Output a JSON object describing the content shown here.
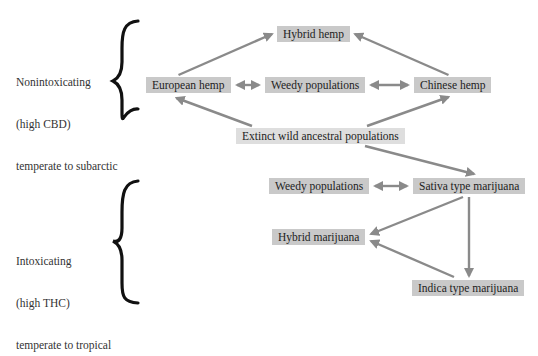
{
  "groups": [
    {
      "id": "nonintoxicating",
      "lines": [
        "Nonintoxicating",
        "(high CBD)",
        "temperate to subarctic"
      ]
    },
    {
      "id": "intoxicating",
      "lines": [
        "Intoxicating",
        "(high THC)",
        "temperate to tropical"
      ]
    }
  ],
  "nodes": {
    "hybrid_hemp": "Hybrid hemp",
    "european_hemp": "European hemp",
    "weedy_populations_hemp": "Weedy populations",
    "chinese_hemp": "Chinese hemp",
    "extinct_ancestral": "Extinct wild ancestral populations",
    "weedy_populations_marijuana": "Weedy populations",
    "sativa_marijuana": "Sativa type marijuana",
    "hybrid_marijuana": "Hybrid marijuana",
    "indica_marijuana": "Indica type marijuana"
  },
  "edges": [
    {
      "from": "european_hemp",
      "to": "hybrid_hemp",
      "type": "directed"
    },
    {
      "from": "chinese_hemp",
      "to": "hybrid_hemp",
      "type": "directed"
    },
    {
      "from": "european_hemp",
      "to": "weedy_populations_hemp",
      "type": "bidirectional"
    },
    {
      "from": "weedy_populations_hemp",
      "to": "chinese_hemp",
      "type": "bidirectional"
    },
    {
      "from": "extinct_ancestral",
      "to": "european_hemp",
      "type": "directed"
    },
    {
      "from": "extinct_ancestral",
      "to": "chinese_hemp",
      "type": "directed"
    },
    {
      "from": "extinct_ancestral",
      "to": "sativa_marijuana",
      "type": "directed"
    },
    {
      "from": "weedy_populations_marijuana",
      "to": "sativa_marijuana",
      "type": "bidirectional"
    },
    {
      "from": "sativa_marijuana",
      "to": "hybrid_marijuana",
      "type": "directed"
    },
    {
      "from": "sativa_marijuana",
      "to": "indica_marijuana",
      "type": "directed"
    },
    {
      "from": "indica_marijuana",
      "to": "hybrid_marijuana",
      "type": "directed"
    }
  ],
  "colors": {
    "node_fill": "#c9c9c9",
    "node_fill_light": "#dedede",
    "arrow": "#8a8a8a",
    "brace": "#111111",
    "text": "#222222"
  }
}
